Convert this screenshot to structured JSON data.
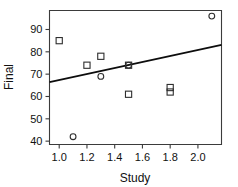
{
  "chart_data": {
    "type": "scatter",
    "title": "",
    "xlabel": "Study",
    "ylabel": "Final",
    "xlim": [
      0.93,
      2.17
    ],
    "ylim": [
      38.5,
      98.5
    ],
    "grid": false,
    "legend": "none",
    "xticks": [
      "1.0",
      "1.2",
      "1.4",
      "1.6",
      "1.8",
      "2.0"
    ],
    "xtick_values": [
      1.0,
      1.2,
      1.4,
      1.6,
      1.8,
      2.0
    ],
    "yticks": [
      "40",
      "50",
      "60",
      "70",
      "80",
      "90"
    ],
    "ytick_values": [
      40,
      50,
      60,
      70,
      80,
      90
    ],
    "series": [
      {
        "name": "square-markers",
        "marker": "square",
        "points": [
          {
            "x": 1.0,
            "y": 85
          },
          {
            "x": 1.2,
            "y": 74
          },
          {
            "x": 1.3,
            "y": 78
          },
          {
            "x": 1.5,
            "y": 74
          },
          {
            "x": 1.5,
            "y": 61
          },
          {
            "x": 1.8,
            "y": 64
          },
          {
            "x": 1.8,
            "y": 62
          }
        ]
      },
      {
        "name": "circle-markers",
        "marker": "circle",
        "points": [
          {
            "x": 1.1,
            "y": 42
          },
          {
            "x": 1.3,
            "y": 69
          },
          {
            "x": 1.5,
            "y": 74
          },
          {
            "x": 2.1,
            "y": 96
          }
        ]
      }
    ],
    "fit_line": {
      "name": "regression-line",
      "x_start": 0.93,
      "y_start": 66.4,
      "x_end": 2.17,
      "y_end": 83.1,
      "slope": 13.5,
      "intercept": 53.8
    },
    "colors": {
      "marker_stroke": "#2e2e2e",
      "line": "#0d0d0d",
      "axis": "#3b3b3b",
      "text": "#111111",
      "background": "#ffffff"
    }
  }
}
